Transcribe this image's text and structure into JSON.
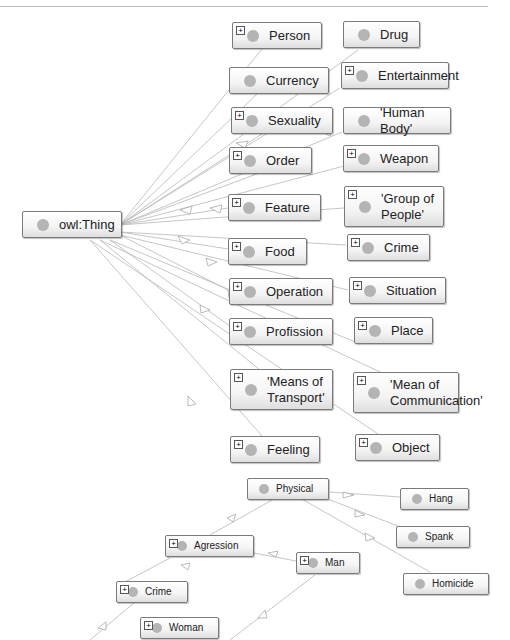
{
  "diagram": {
    "type": "ontology-class-graph",
    "root": {
      "label": "owl:Thing"
    },
    "top_nodes": [
      {
        "id": "person",
        "label": "Person",
        "expandable": true
      },
      {
        "id": "drug",
        "label": "Drug",
        "expandable": false
      },
      {
        "id": "currency",
        "label": "Currency",
        "expandable": false
      },
      {
        "id": "entertainment",
        "label": "Entertainment",
        "expandable": true
      },
      {
        "id": "sexuality",
        "label": "Sexuality",
        "expandable": true
      },
      {
        "id": "human-body",
        "label": "'Human Body'",
        "expandable": false
      },
      {
        "id": "order",
        "label": "Order",
        "expandable": true
      },
      {
        "id": "weapon",
        "label": "Weapon",
        "expandable": true
      },
      {
        "id": "feature",
        "label": "Feature",
        "expandable": true
      },
      {
        "id": "group-of-people",
        "label": "'Group of\nPeople'",
        "expandable": true
      },
      {
        "id": "food",
        "label": "Food",
        "expandable": true
      },
      {
        "id": "crime",
        "label": "Crime",
        "expandable": true
      },
      {
        "id": "operation",
        "label": "Operation",
        "expandable": true
      },
      {
        "id": "situation",
        "label": "Situation",
        "expandable": true
      },
      {
        "id": "profission",
        "label": "Profission",
        "expandable": true
      },
      {
        "id": "place",
        "label": "Place",
        "expandable": true
      },
      {
        "id": "means-of-transport",
        "label": "'Means of\nTransport'",
        "expandable": true
      },
      {
        "id": "mean-of-communication",
        "label": "'Mean of\nCommunication'",
        "expandable": true
      },
      {
        "id": "feeling",
        "label": "Feeling",
        "expandable": true
      },
      {
        "id": "object",
        "label": "Object",
        "expandable": true
      }
    ],
    "bottom_nodes": [
      {
        "id": "physical",
        "label": "Physical",
        "expandable": false
      },
      {
        "id": "hang",
        "label": "Hang",
        "expandable": false
      },
      {
        "id": "spank",
        "label": "Spank",
        "expandable": false
      },
      {
        "id": "homicide",
        "label": "Homicide",
        "expandable": false
      },
      {
        "id": "agression",
        "label": "Agression",
        "expandable": true
      },
      {
        "id": "man",
        "label": "Man",
        "expandable": true
      },
      {
        "id": "crime2",
        "label": "Crime",
        "expandable": true
      },
      {
        "id": "woman",
        "label": "Woman",
        "expandable": true
      }
    ],
    "colors": {
      "node_border": "#7a7a7a",
      "node_dot": "#b4b4b4",
      "edge": "#b0b0b0"
    }
  }
}
